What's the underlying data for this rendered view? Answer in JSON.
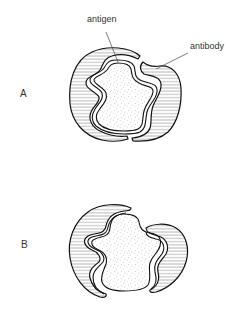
{
  "figure": {
    "panels": [
      {
        "id": "A",
        "label": "A",
        "state": "antibody closely bound around antigen",
        "annotations": [
          {
            "text": "antigen",
            "points_to": "stippled central shape"
          },
          {
            "text": "antibody",
            "points_to": "hatched outer shape"
          }
        ]
      },
      {
        "id": "B",
        "label": "B",
        "state": "antibody loosely fitting around antigen"
      }
    ],
    "annotations": {
      "antigen": "antigen",
      "antibody": "antibody"
    },
    "colors": {
      "stroke": "#111111",
      "hatch": "#555555",
      "stipple": "#777777",
      "text": "#333333",
      "background": "#ffffff"
    }
  }
}
